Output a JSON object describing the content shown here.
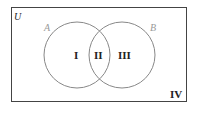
{
  "diagram": {
    "type": "venn",
    "universe_label": "U",
    "sets": [
      {
        "label": "A"
      },
      {
        "label": "B"
      }
    ],
    "regions": [
      {
        "id": "I",
        "label": "I",
        "description": "A only"
      },
      {
        "id": "II",
        "label": "II",
        "description": "A and B"
      },
      {
        "id": "III",
        "label": "III",
        "description": "B only"
      },
      {
        "id": "IV",
        "label": "IV",
        "description": "neither A nor B"
      }
    ]
  },
  "colors": {
    "border": "#444444",
    "circle": "#888888",
    "set_label": "#999999",
    "region_label": "#222222"
  }
}
